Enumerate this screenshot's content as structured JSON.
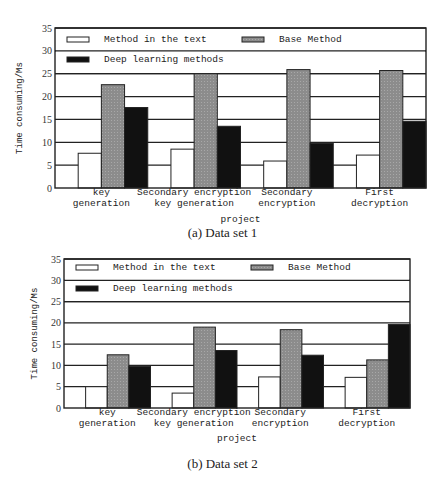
{
  "figure": {
    "captions": [
      "(a) Data set 1",
      "(b) Data set 2"
    ]
  },
  "colors": {
    "method_in_text": "#ffffff",
    "base_method": "#8c8c8c",
    "deep_learning": "#111111",
    "grid": "#222222"
  },
  "chart_data": [
    {
      "type": "bar",
      "title": "(a) Data set 1",
      "xlabel": "project",
      "ylabel": "Time consuming/Ms",
      "ylim": [
        0,
        35
      ],
      "yticks": [
        0,
        5,
        10,
        15,
        20,
        25,
        30,
        35
      ],
      "grid": true,
      "legend_position": "top-inside",
      "categories": [
        "key generation",
        "Secondary encryption key generation",
        "Secondary encryption",
        "First decryption"
      ],
      "category_labels": [
        [
          "key",
          "generation"
        ],
        [
          "Secondary encryption",
          "key generation"
        ],
        [
          "Secondary",
          "encryption"
        ],
        [
          "First",
          "decryption"
        ]
      ],
      "series": [
        {
          "name": "Method in the text",
          "values": [
            7.6,
            8.5,
            5.9,
            7.2
          ]
        },
        {
          "name": "Base Method",
          "values": [
            22.6,
            25.0,
            25.9,
            25.7
          ]
        },
        {
          "name": "Deep learning methods",
          "values": [
            17.6,
            13.5,
            9.8,
            14.6
          ]
        }
      ]
    },
    {
      "type": "bar",
      "title": "(b) Data set 2",
      "xlabel": "project",
      "ylabel": "Time consuming/Ms",
      "ylim": [
        0,
        35
      ],
      "yticks": [
        0,
        5,
        10,
        15,
        20,
        25,
        30,
        35
      ],
      "grid": true,
      "legend_position": "top-inside",
      "categories": [
        "key generation",
        "Secondary encryption key generation",
        "Secondary encryption",
        "First decryption"
      ],
      "category_labels": [
        [
          "key",
          "generation"
        ],
        [
          "Secondary encryption",
          "key generation"
        ],
        [
          "Secondary",
          "encryption"
        ],
        [
          "First",
          "decryption"
        ]
      ],
      "series": [
        {
          "name": "Method in the text",
          "values": [
            5.0,
            3.5,
            7.3,
            7.2
          ]
        },
        {
          "name": "Base Method",
          "values": [
            12.5,
            19.0,
            18.4,
            11.3
          ]
        },
        {
          "name": "Deep learning methods",
          "values": [
            9.8,
            13.5,
            12.4,
            19.6
          ]
        }
      ]
    }
  ]
}
